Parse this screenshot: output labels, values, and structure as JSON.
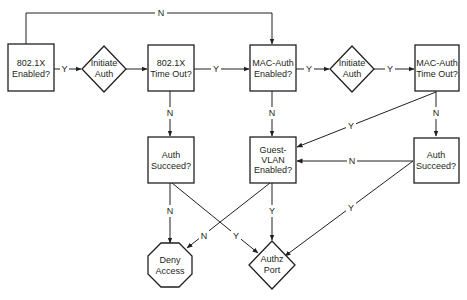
{
  "diagram": {
    "type": "flowchart",
    "nodes": {
      "dot1x_enabled": {
        "lines": [
          "802.1X",
          "Enabled?"
        ],
        "shape": "rect"
      },
      "initiate_auth_1": {
        "lines": [
          "Initiate",
          "Auth"
        ],
        "shape": "diamond"
      },
      "dot1x_timeout": {
        "lines": [
          "802.1X",
          "Time Out?"
        ],
        "shape": "rect"
      },
      "mac_auth_enabled": {
        "lines": [
          "MAC-Auth",
          "Enabled?"
        ],
        "shape": "rect"
      },
      "initiate_auth_2": {
        "lines": [
          "Initiate",
          "Auth"
        ],
        "shape": "diamond"
      },
      "mac_auth_timeout": {
        "lines": [
          "MAC-Auth",
          "Time Out?"
        ],
        "shape": "rect"
      },
      "auth_succeed_1": {
        "lines": [
          "Auth",
          "Succeed?"
        ],
        "shape": "rect"
      },
      "guest_vlan_enabled": {
        "lines": [
          "Guest-",
          "VLAN",
          "Enabled?"
        ],
        "shape": "rect"
      },
      "auth_succeed_2": {
        "lines": [
          "Auth",
          "Succeed?"
        ],
        "shape": "rect"
      },
      "deny_access": {
        "lines": [
          "Deny",
          "Access"
        ],
        "shape": "octagon"
      },
      "authz_port": {
        "lines": [
          "Authz",
          "Port"
        ],
        "shape": "diamond"
      }
    },
    "edges": [
      {
        "from": "dot1x_enabled",
        "to": "mac_auth_enabled",
        "label": "N"
      },
      {
        "from": "dot1x_enabled",
        "to": "initiate_auth_1",
        "label": "Y"
      },
      {
        "from": "initiate_auth_1",
        "to": "dot1x_timeout",
        "label": ""
      },
      {
        "from": "dot1x_timeout",
        "to": "mac_auth_enabled",
        "label": "Y"
      },
      {
        "from": "dot1x_timeout",
        "to": "auth_succeed_1",
        "label": "N"
      },
      {
        "from": "mac_auth_enabled",
        "to": "initiate_auth_2",
        "label": "Y"
      },
      {
        "from": "mac_auth_enabled",
        "to": "guest_vlan_enabled",
        "label": "N"
      },
      {
        "from": "initiate_auth_2",
        "to": "mac_auth_timeout",
        "label": "Y"
      },
      {
        "from": "mac_auth_timeout",
        "to": "guest_vlan_enabled",
        "label": "Y"
      },
      {
        "from": "mac_auth_timeout",
        "to": "auth_succeed_2",
        "label": "N"
      },
      {
        "from": "auth_succeed_1",
        "to": "deny_access",
        "label": "N"
      },
      {
        "from": "auth_succeed_1",
        "to": "authz_port",
        "label": "Y"
      },
      {
        "from": "guest_vlan_enabled",
        "to": "deny_access",
        "label": "N"
      },
      {
        "from": "guest_vlan_enabled",
        "to": "authz_port",
        "label": "Y"
      },
      {
        "from": "auth_succeed_2",
        "to": "guest_vlan_enabled",
        "label": "N"
      },
      {
        "from": "auth_succeed_2",
        "to": "authz_port",
        "label": "Y"
      }
    ],
    "labels": {
      "yes": "Y",
      "no": "N"
    },
    "colors": {
      "stroke": "#231f20",
      "fill": "#ffffff",
      "text": "#231f20"
    }
  }
}
